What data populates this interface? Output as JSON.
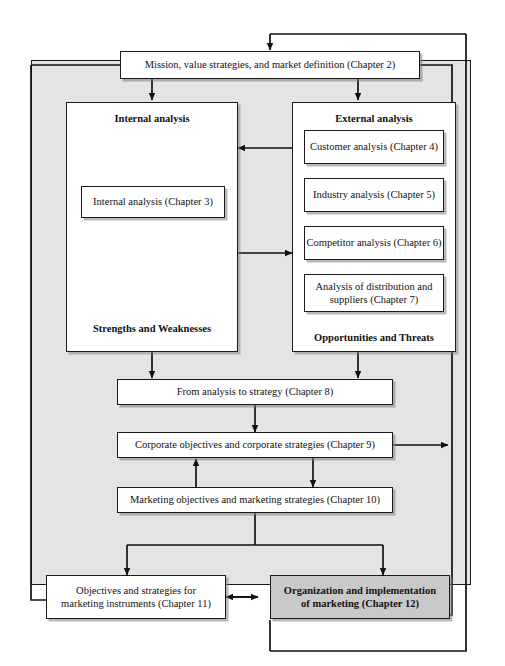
{
  "diagram": {
    "colors": {
      "backdrop": "#e4e4e4",
      "node_fill": "#ffffff",
      "highlight_fill": "#c9c9c9",
      "stroke": "#1a1a1a"
    },
    "nodes": {
      "mission": "Mission, value strategies, and market definition (Chapter 2)",
      "internal_panel_title": "Internal analysis",
      "internal_panel_footer": "Strengths and Weaknesses",
      "internal_box": "Internal analysis (Chapter 3)",
      "external_panel_title": "External analysis",
      "external_panel_footer": "Opportunities and Threats",
      "customer": "Customer analysis (Chapter 4)",
      "industry": "Industry analysis (Chapter 5)",
      "competitor": "Competitor analysis (Chapter 6)",
      "distribution": "Analysis of distribution and suppliers (Chapter 7)",
      "from_analysis": "From analysis to strategy (Chapter 8)",
      "corporate": "Corporate objectives and corporate strategies (Chapter 9)",
      "marketing": "Marketing objectives and marketing strategies (Chapter 10)",
      "instruments": "Objectives and strategies for marketing instruments (Chapter 11)",
      "organization": "Organization and implementation of marketing (Chapter 12)"
    }
  }
}
